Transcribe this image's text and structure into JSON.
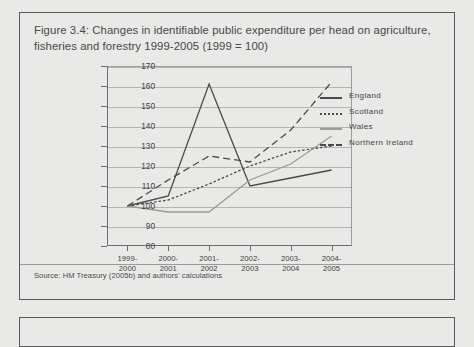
{
  "figure": {
    "title": "Figure 3.4: Changes in identifiable public expenditure per head on agriculture, fisheries and forestry 1999-2005 (1999 = 100)",
    "source": "Source: HM Treasury (2005b) and authors' calculations"
  },
  "chart_data": {
    "type": "line",
    "title": "Changes in identifiable public expenditure per head on agriculture, fisheries and forestry 1999-2005 (1999 = 100)",
    "xlabel": "",
    "ylabel": "",
    "ylim": [
      80,
      170
    ],
    "ytick_labels": [
      "170",
      "160",
      "150",
      "140",
      "130",
      "120",
      "110",
      "100",
      "90",
      "80"
    ],
    "yticks": [
      170,
      160,
      150,
      140,
      130,
      120,
      110,
      100,
      90,
      80
    ],
    "grid": true,
    "legend_position": "right",
    "categories": [
      "1999-2000",
      "2000-2001",
      "2001-2002",
      "2002-2003",
      "2003-2004",
      "2004-2005"
    ],
    "series": [
      {
        "name": "England",
        "style": "solid",
        "color": "#4a4a4a",
        "values": [
          100,
          105,
          161,
          110,
          114,
          118
        ]
      },
      {
        "name": "Scotland",
        "style": "dotted",
        "color": "#4a4a4a",
        "values": [
          100,
          103,
          111,
          120,
          127,
          130
        ]
      },
      {
        "name": "Wales",
        "style": "solid",
        "color": "#9a9a98",
        "values": [
          100,
          97,
          97,
          113,
          121,
          135
        ]
      },
      {
        "name": "Northern Ireland",
        "style": "dashed",
        "color": "#4a4a4a",
        "values": [
          100,
          113,
          125,
          122,
          138,
          162
        ]
      }
    ]
  }
}
